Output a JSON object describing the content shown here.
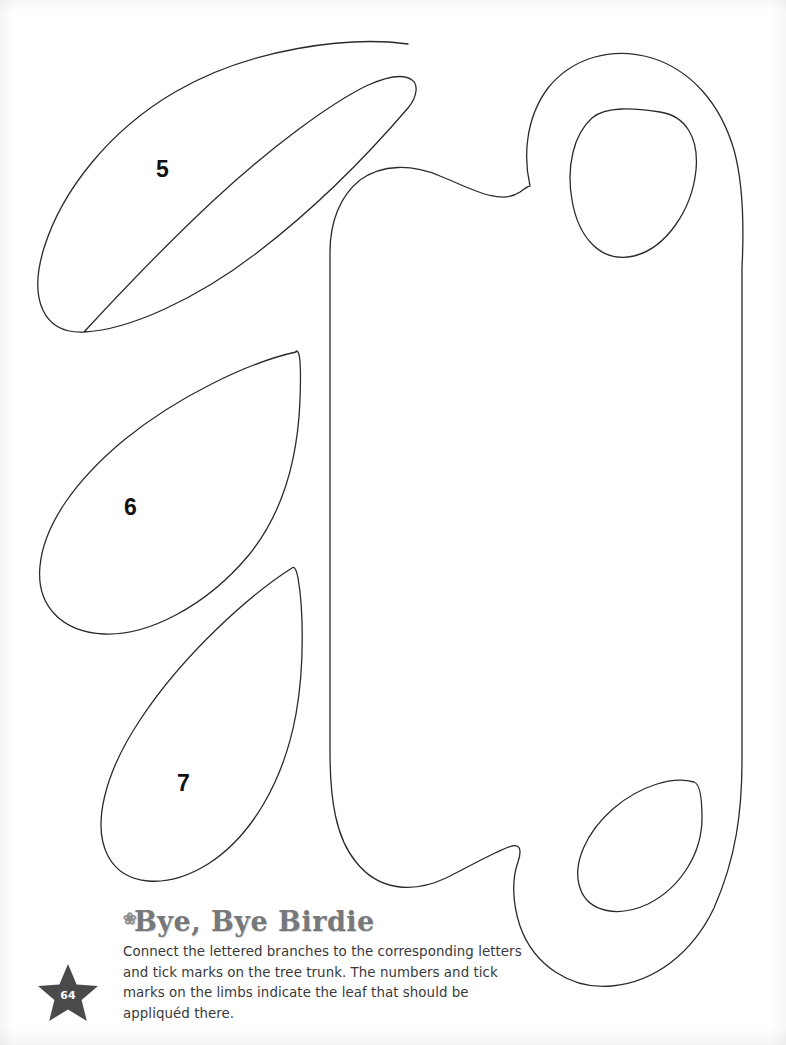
{
  "page": {
    "number": "64",
    "width": 786,
    "height": 1045,
    "background_color": "#ffffff",
    "outline_color": "#2b2b2b"
  },
  "caption": {
    "title": "Bye, Bye Birdie",
    "title_color": "#77787a",
    "body": "Connect the lettered branches to the corresponding letters and tick marks on the tree trunk. The numbers and tick marks on the limbs indicate the leaf that should be appliquéd there.",
    "body_color": "#39393b"
  },
  "badge": {
    "icon": "star-icon",
    "fill_color": "#4a4a4a",
    "label": "64"
  },
  "pattern": {
    "title": "Applique leaf and trunk pattern pieces",
    "pieces": [
      {
        "id": "leaf-5",
        "label": "5",
        "type": "paisley-leaf",
        "label_x": 156,
        "label_y": 158
      },
      {
        "id": "leaf-6",
        "label": "6",
        "type": "teardrop-leaf",
        "label_x": 124,
        "label_y": 496
      },
      {
        "id": "leaf-7",
        "label": "7",
        "type": "teardrop-leaf",
        "label_x": 177,
        "label_y": 772
      },
      {
        "id": "trunk-piece",
        "label": "",
        "type": "tree-trunk-outline",
        "label_x": 0,
        "label_y": 0
      },
      {
        "id": "trunk-inner-leaf-top",
        "label": "",
        "type": "inner-leaf-cutout",
        "label_x": 0,
        "label_y": 0
      },
      {
        "id": "trunk-inner-leaf-bottom",
        "label": "",
        "type": "inner-leaf-cutout",
        "label_x": 0,
        "label_y": 0
      }
    ]
  }
}
